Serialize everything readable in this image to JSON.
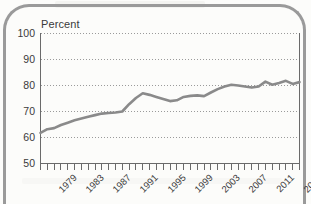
{
  "figure": {
    "unit_label": "Percent",
    "border_color": "#9a9a9a",
    "line_color": "#8a8a8a",
    "grid_color": "#9a9a9a",
    "axis_color": "#6a6a6a",
    "background": "#fcfcfa"
  },
  "chart_data": {
    "type": "line",
    "title": "",
    "subtitle": "",
    "xlabel": "",
    "ylabel": "Percent",
    "ylim": [
      50,
      100
    ],
    "xlim": [
      1979,
      2017
    ],
    "ytick_labels": [
      "100",
      "90",
      "80",
      "70",
      "60",
      "50"
    ],
    "ytick_values": [
      100,
      90,
      80,
      70,
      60,
      50
    ],
    "xtick_labels": [
      "1979",
      "1983",
      "1987",
      "1991",
      "1995",
      "1999",
      "2003",
      "2007",
      "2011",
      "2015"
    ],
    "xtick_values": [
      1979,
      1983,
      1987,
      1991,
      1995,
      1999,
      2003,
      2007,
      2011,
      2015
    ],
    "minor_xticks_every": 1,
    "grid": "horizontal-dotted",
    "legend": "none",
    "annotations": [],
    "x": [
      1979,
      1980,
      1981,
      1982,
      1983,
      1984,
      1985,
      1986,
      1987,
      1988,
      1989,
      1990,
      1991,
      1992,
      1993,
      1994,
      1995,
      1996,
      1997,
      1998,
      1999,
      2000,
      2001,
      2002,
      2003,
      2004,
      2005,
      2006,
      2007,
      2008,
      2009,
      2010,
      2011,
      2012,
      2013,
      2014,
      2015,
      2016,
      2017
    ],
    "values": [
      61.8,
      63.2,
      63.6,
      64.8,
      65.7,
      66.6,
      67.3,
      68.0,
      68.6,
      69.2,
      69.4,
      69.6,
      70.0,
      72.8,
      75.2,
      77.0,
      76.4,
      75.6,
      74.8,
      74.0,
      74.3,
      75.6,
      76.0,
      76.2,
      75.9,
      77.3,
      78.6,
      79.6,
      80.3,
      80.0,
      79.6,
      79.2,
      79.6,
      81.5,
      80.3,
      81.0,
      81.8,
      80.6,
      81.3
    ],
    "series": [
      {
        "name": "Percent",
        "values": [
          61.8,
          63.2,
          63.6,
          64.8,
          65.7,
          66.6,
          67.3,
          68.0,
          68.6,
          69.2,
          69.4,
          69.6,
          70.0,
          72.8,
          75.2,
          77.0,
          76.4,
          75.6,
          74.8,
          74.0,
          74.3,
          75.6,
          76.0,
          76.2,
          75.9,
          77.3,
          78.6,
          79.6,
          80.3,
          80.0,
          79.6,
          79.2,
          79.6,
          81.5,
          80.3,
          81.0,
          81.8,
          80.6,
          81.3
        ]
      }
    ]
  }
}
